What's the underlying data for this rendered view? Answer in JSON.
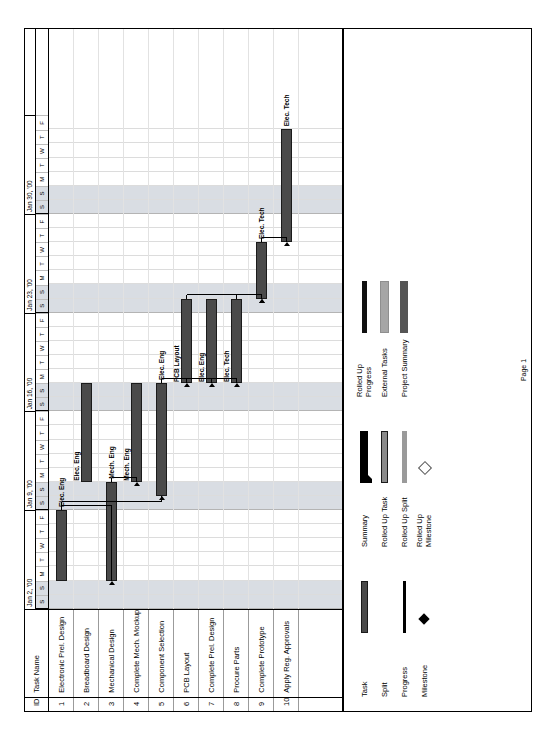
{
  "document": {
    "footer_label": "Page 1"
  },
  "table": {
    "headers": {
      "id": "ID",
      "name": "Task Name"
    },
    "rows": [
      {
        "id": "1",
        "name": "Electronic Prel. Design"
      },
      {
        "id": "2",
        "name": "Breadboard Design"
      },
      {
        "id": "3",
        "name": "Mechanical Design"
      },
      {
        "id": "4",
        "name": "Complete Mech. Mockup"
      },
      {
        "id": "5",
        "name": "Component Selection"
      },
      {
        "id": "6",
        "name": "PCB Layout"
      },
      {
        "id": "7",
        "name": "Complete Prel. Design"
      },
      {
        "id": "8",
        "name": "Procure Parts"
      },
      {
        "id": "9",
        "name": "Complete Prototype"
      },
      {
        "id": "10",
        "name": "Apply Reg. Approvals"
      }
    ]
  },
  "timeline": {
    "weeks": [
      {
        "label": "Jan 2, '00"
      },
      {
        "label": "Jan 9, '00"
      },
      {
        "label": "Jan 16, '00"
      },
      {
        "label": "Jan 23, '00"
      },
      {
        "label": "Jan 30, '00"
      }
    ],
    "day_letters": [
      "S",
      "S",
      "M",
      "T",
      "W",
      "T",
      "F"
    ],
    "days_full": [
      "S",
      "S",
      "M",
      "T",
      "W",
      "T",
      "F",
      "S",
      "S",
      "M",
      "T",
      "W",
      "T",
      "F",
      "S",
      "S",
      "M",
      "T",
      "W",
      "T",
      "F",
      "S",
      "S",
      "M",
      "T",
      "W",
      "T",
      "F",
      "S",
      "S",
      "M",
      "T",
      "W",
      "T",
      "F"
    ]
  },
  "chart_data": {
    "type": "bar",
    "xlabel": "",
    "ylabel": "",
    "categories": [
      "Electronic Prel. Design",
      "Breadboard Design",
      "Mechanical Design",
      "Complete Mech. Mockup",
      "Component Selection",
      "PCB Layout",
      "Complete Prel. Design",
      "Procure Parts",
      "Complete Prototype",
      "Apply Reg. Approvals"
    ],
    "axis_range": [
      "Jan 2, '00",
      "Feb 5, '00"
    ],
    "bars": [
      {
        "row": 1,
        "task": "Electronic Prel. Design",
        "start_day": 2,
        "end_day": 7,
        "resource": "Elec. Eng",
        "label_side": "right",
        "type": "task"
      },
      {
        "row": 2,
        "task": "Breadboard Design",
        "start_day": 9,
        "end_day": 16,
        "resource": "Elec. Eng",
        "label_side": "above",
        "type": "task"
      },
      {
        "row": 3,
        "task": "Mechanical Design",
        "start_day": 2,
        "end_day": 9,
        "resource": "Mech. Eng",
        "label_side": "right",
        "type": "task"
      },
      {
        "row": 4,
        "task": "Complete Mech. Mockup",
        "start_day": 9,
        "end_day": 16,
        "resource": "Mech. Eng",
        "label_side": "above",
        "type": "task"
      },
      {
        "row": 5,
        "task": "Component Selection",
        "start_day": 8,
        "end_day": 16,
        "resource": "Elec. Eng",
        "label_side": "right",
        "type": "task"
      },
      {
        "row": 6,
        "task": "PCB Layout",
        "start_day": 16,
        "end_day": 22,
        "resource": "PCB Layout",
        "label_side": "above",
        "type": "task"
      },
      {
        "row": 7,
        "task": "Complete Prel. Design",
        "start_day": 16,
        "end_day": 22,
        "resource": "Elec. Eng",
        "label_side": "above",
        "type": "task"
      },
      {
        "row": 8,
        "task": "Procure Parts",
        "start_day": 16,
        "end_day": 22,
        "resource": "Elec. Tech",
        "label_side": "above",
        "type": "task"
      },
      {
        "row": 9,
        "task": "Complete Prototype",
        "start_day": 22,
        "end_day": 26,
        "resource": "Elec. Tech",
        "label_side": "right",
        "type": "task"
      },
      {
        "row": 10,
        "task": "Apply Reg. Approvals",
        "start_day": 26,
        "end_day": 34,
        "resource": "Elec. Tech",
        "label_side": "right",
        "type": "task"
      }
    ]
  },
  "legend": {
    "columns": [
      {
        "items": [
          {
            "label": "Task",
            "symbol": "task-bar"
          },
          {
            "label": "Split",
            "symbol": "split-bar"
          },
          {
            "label": "Progress",
            "symbol": "progress-bar"
          },
          {
            "label": "Milestone",
            "symbol": "milestone-diamond"
          }
        ]
      },
      {
        "items": [
          {
            "label": "Summary",
            "symbol": "summary-bar"
          },
          {
            "label": "Rolled Up Task",
            "symbol": "rolled-up-task-bar"
          },
          {
            "label": "Rolled Up Split",
            "symbol": "rolled-up-split-bar"
          },
          {
            "label": "Rolled Up Milestone",
            "symbol": "rolled-up-milestone-diamond"
          }
        ]
      },
      {
        "items": [
          {
            "label": "Rolled Up Progress",
            "symbol": "rolled-up-progress-bar"
          },
          {
            "label": "External Tasks",
            "symbol": "external-task-bar"
          },
          {
            "label": "Project Summary",
            "symbol": "project-summary-bar"
          }
        ]
      }
    ]
  },
  "colors": {
    "bar_fill": "#4a4a4a",
    "bar_border": "#1b1b1b",
    "weekend_shade": "#d9dde3",
    "external_fill": "#a6a6a6"
  }
}
